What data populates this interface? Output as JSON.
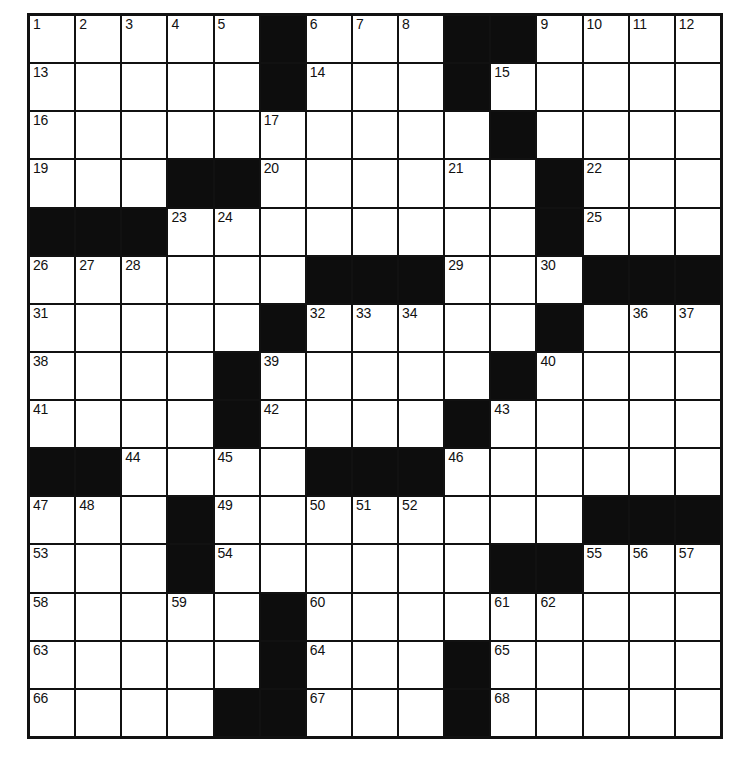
{
  "puzzle": {
    "kind": "crossword-grid",
    "rows": 15,
    "columns": 15,
    "cell_colors": {
      "open": "#ffffff",
      "block": "#0d0d0d",
      "border": "#111111",
      "number_text": "#111111"
    },
    "legend": {
      "open": ".",
      "block": "#"
    },
    "layout": [
      ".....#...##....",
      ".....#...#.....",
      "..........#....",
      "...##......#...",
      "###........#...",
      "......###...###",
      ".....#.....#...",
      "....#.....#....",
      "....#....#.....",
      "##....###......",
      "...#........###",
      "...#......##...",
      ".....#.........",
      ".....#...#.....",
      "....##...#....."
    ],
    "numbered_cells": [
      {
        "number": 1,
        "row": 0,
        "col": 0
      },
      {
        "number": 2,
        "row": 0,
        "col": 1
      },
      {
        "number": 3,
        "row": 0,
        "col": 2
      },
      {
        "number": 4,
        "row": 0,
        "col": 3
      },
      {
        "number": 5,
        "row": 0,
        "col": 4
      },
      {
        "number": 6,
        "row": 0,
        "col": 6
      },
      {
        "number": 7,
        "row": 0,
        "col": 7
      },
      {
        "number": 8,
        "row": 0,
        "col": 8
      },
      {
        "number": 9,
        "row": 0,
        "col": 11
      },
      {
        "number": 10,
        "row": 0,
        "col": 12
      },
      {
        "number": 11,
        "row": 0,
        "col": 13
      },
      {
        "number": 12,
        "row": 0,
        "col": 14
      },
      {
        "number": 13,
        "row": 1,
        "col": 0
      },
      {
        "number": 14,
        "row": 1,
        "col": 6
      },
      {
        "number": 15,
        "row": 1,
        "col": 10
      },
      {
        "number": 16,
        "row": 2,
        "col": 0
      },
      {
        "number": 17,
        "row": 2,
        "col": 5
      },
      {
        "number": 18,
        "row": 2,
        "col": 10
      },
      {
        "number": 19,
        "row": 3,
        "col": 0
      },
      {
        "number": 20,
        "row": 3,
        "col": 5
      },
      {
        "number": 21,
        "row": 3,
        "col": 9
      },
      {
        "number": 22,
        "row": 3,
        "col": 12
      },
      {
        "number": 23,
        "row": 4,
        "col": 3
      },
      {
        "number": 24,
        "row": 4,
        "col": 4
      },
      {
        "number": 25,
        "row": 4,
        "col": 12
      },
      {
        "number": 26,
        "row": 5,
        "col": 0
      },
      {
        "number": 27,
        "row": 5,
        "col": 1
      },
      {
        "number": 28,
        "row": 5,
        "col": 2
      },
      {
        "number": 29,
        "row": 5,
        "col": 9
      },
      {
        "number": 30,
        "row": 5,
        "col": 11
      },
      {
        "number": 31,
        "row": 6,
        "col": 0
      },
      {
        "number": 32,
        "row": 6,
        "col": 6
      },
      {
        "number": 33,
        "row": 6,
        "col": 7
      },
      {
        "number": 34,
        "row": 6,
        "col": 8
      },
      {
        "number": 35,
        "row": 6,
        "col": 11
      },
      {
        "number": 36,
        "row": 6,
        "col": 13
      },
      {
        "number": 37,
        "row": 6,
        "col": 14
      },
      {
        "number": 38,
        "row": 7,
        "col": 0
      },
      {
        "number": 39,
        "row": 7,
        "col": 5
      },
      {
        "number": 40,
        "row": 7,
        "col": 11
      },
      {
        "number": 41,
        "row": 8,
        "col": 0
      },
      {
        "number": 42,
        "row": 8,
        "col": 5
      },
      {
        "number": 43,
        "row": 8,
        "col": 10
      },
      {
        "number": 44,
        "row": 9,
        "col": 2
      },
      {
        "number": 45,
        "row": 9,
        "col": 4
      },
      {
        "number": 46,
        "row": 9,
        "col": 9
      },
      {
        "number": 47,
        "row": 10,
        "col": 0
      },
      {
        "number": 48,
        "row": 10,
        "col": 1
      },
      {
        "number": 49,
        "row": 10,
        "col": 4
      },
      {
        "number": 50,
        "row": 10,
        "col": 6
      },
      {
        "number": 51,
        "row": 10,
        "col": 7
      },
      {
        "number": 52,
        "row": 10,
        "col": 8
      },
      {
        "number": 53,
        "row": 11,
        "col": 0
      },
      {
        "number": 54,
        "row": 11,
        "col": 4
      },
      {
        "number": 55,
        "row": 11,
        "col": 12
      },
      {
        "number": 56,
        "row": 11,
        "col": 13
      },
      {
        "number": 57,
        "row": 11,
        "col": 14
      },
      {
        "number": 58,
        "row": 12,
        "col": 0
      },
      {
        "number": 59,
        "row": 12,
        "col": 3
      },
      {
        "number": 60,
        "row": 12,
        "col": 6
      },
      {
        "number": 61,
        "row": 12,
        "col": 10
      },
      {
        "number": 62,
        "row": 12,
        "col": 11
      },
      {
        "number": 63,
        "row": 13,
        "col": 0
      },
      {
        "number": 64,
        "row": 13,
        "col": 6
      },
      {
        "number": 65,
        "row": 13,
        "col": 10
      },
      {
        "number": 66,
        "row": 14,
        "col": 0
      },
      {
        "number": 67,
        "row": 14,
        "col": 6
      },
      {
        "number": 68,
        "row": 14,
        "col": 10
      }
    ],
    "entered_letters": []
  }
}
